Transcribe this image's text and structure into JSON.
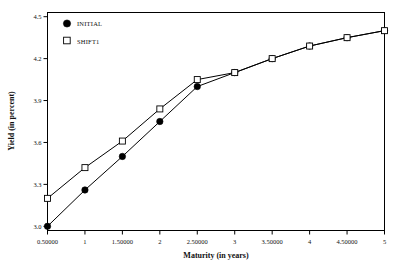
{
  "chart_data": {
    "type": "line",
    "title": "",
    "xlabel": "Maturity (in years)",
    "ylabel": "Yield (in percent)",
    "xlim": [
      0.5,
      5
    ],
    "ylim": [
      2.97,
      4.53
    ],
    "grid": false,
    "legend_position": "top-left-inside",
    "x": [
      0.5,
      1,
      1.5,
      2,
      2.5,
      3,
      3.5,
      4,
      4.5,
      5
    ],
    "xtick_labels": [
      "0.50000",
      "1",
      "1.50000",
      "2",
      "2.50000",
      "3",
      "3.50000",
      "4",
      "4.50000",
      "5"
    ],
    "ytick_labels": [
      "3.0",
      "3.3",
      "3.6",
      "3.9",
      "4.2",
      "4.5"
    ],
    "ytick_values": [
      3.0,
      3.3,
      3.6,
      3.9,
      4.2,
      4.5
    ],
    "series": [
      {
        "name": "INITIAL",
        "marker": "filled-circle",
        "values": [
          3.0,
          3.26,
          3.5,
          3.75,
          4.0,
          4.1,
          4.2,
          4.29,
          4.35,
          4.4
        ]
      },
      {
        "name": "SHIFT1",
        "marker": "open-square",
        "values": [
          3.2,
          3.42,
          3.61,
          3.84,
          4.05,
          4.1,
          4.2,
          4.29,
          4.35,
          4.4
        ]
      }
    ]
  },
  "legend": {
    "entries": [
      {
        "label": "INITIAL",
        "marker": "filled-circle"
      },
      {
        "label": "SHIFT1",
        "marker": "open-square"
      }
    ]
  },
  "axes": {
    "x_title": "Maturity (in years)",
    "y_title": "Yield (in percent)"
  }
}
